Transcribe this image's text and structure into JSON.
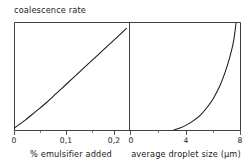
{
  "figure": {
    "width": 251,
    "height": 165,
    "background": "#ffffff",
    "ink_color": "#1a1a1a"
  },
  "y_axis": {
    "title": "coalescence rate",
    "ticks": [],
    "show_scale": false
  },
  "panels": [
    {
      "id": "left",
      "xlabel": "% emulsifier added",
      "tick_labels": [
        "0",
        "0,1",
        "0,2"
      ],
      "tick_values": [
        0,
        0.1,
        0.2
      ],
      "minor_tick_values": [
        0.05,
        0.15
      ],
      "xlim": [
        0,
        0.22
      ]
    },
    {
      "id": "right",
      "xlabel": "average droplet size (μm)",
      "tick_labels": [
        "0",
        "4",
        "8"
      ],
      "tick_values": [
        0,
        4,
        8
      ],
      "minor_tick_values": [
        2,
        6
      ],
      "xlim": [
        0,
        8.3
      ]
    }
  ],
  "chart_data": {
    "type": "line",
    "title": "",
    "ylabel": "coalescence rate",
    "ylim": [
      0,
      1
    ],
    "grid": false,
    "legend": null,
    "panels": [
      {
        "name": "left",
        "xlabel": "% emulsifier added",
        "xlim": [
          0,
          0.22
        ],
        "xticks": [
          0,
          0.1,
          0.2
        ],
        "xticklabels": [
          "0",
          "0,1",
          "0,2"
        ],
        "series": [
          {
            "name": "coalescence rate vs emulsifier",
            "shape": "slightly-concave-up rising, near-linear",
            "x": [
              0.0,
              0.02,
              0.04,
              0.06,
              0.08,
              0.1,
              0.12,
              0.14,
              0.16,
              0.18,
              0.2,
              0.215
            ],
            "y": [
              0.02,
              0.09,
              0.17,
              0.25,
              0.34,
              0.43,
              0.52,
              0.61,
              0.7,
              0.79,
              0.88,
              0.95
            ]
          }
        ]
      },
      {
        "name": "right",
        "xlabel": "average droplet size (μm)",
        "xlim": [
          0,
          8.3
        ],
        "xticks": [
          0,
          4,
          8
        ],
        "xticklabels": [
          "0",
          "4",
          "8"
        ],
        "series": [
          {
            "name": "coalescence rate vs droplet size",
            "shape": "exponential rise, flat until ~3.5 then steep",
            "x": [
              3.3,
              3.8,
              4.3,
              4.8,
              5.3,
              5.8,
              6.3,
              6.8,
              7.2,
              7.5,
              7.75,
              7.9,
              8.0
            ],
            "y": [
              0.0,
              0.02,
              0.05,
              0.09,
              0.14,
              0.21,
              0.3,
              0.42,
              0.55,
              0.67,
              0.79,
              0.9,
              1.0
            ]
          }
        ]
      }
    ]
  }
}
